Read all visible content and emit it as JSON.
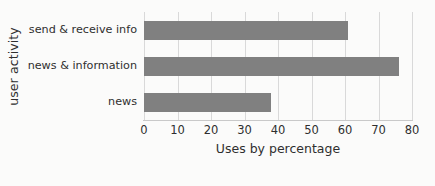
{
  "chart_data": {
    "type": "bar",
    "orientation": "horizontal",
    "title": "",
    "xlabel": "Uses by percentage",
    "ylabel": "user activity",
    "categories": [
      "send & receive info",
      "news & information",
      "news"
    ],
    "values": [
      61,
      76,
      38
    ],
    "series": [
      {
        "name": "Uses by percentage",
        "values": [
          61,
          76,
          38
        ]
      }
    ],
    "xlim": [
      0,
      80
    ],
    "xticks": [
      0,
      10,
      20,
      30,
      40,
      50,
      60,
      70,
      80
    ],
    "xtick_labels": [
      "0",
      "10",
      "20",
      "30",
      "40",
      "50",
      "60",
      "70",
      "80"
    ],
    "grid": "vertical-only",
    "legend": "none",
    "bar_color": "#808080",
    "gridline_color": "#d9d9d9",
    "background_color": "#fbfbfa",
    "text_color": "#2f2f2f"
  }
}
